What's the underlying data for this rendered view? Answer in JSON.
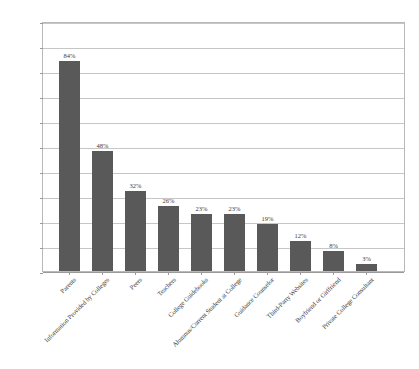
{
  "chart_data": {
    "type": "bar",
    "title": "",
    "xlabel": "",
    "ylabel": "",
    "ylim": [
      0,
      100
    ],
    "grid": true,
    "legend": "none",
    "y_ticks": [
      "0%",
      "10%",
      "20%",
      "30%",
      "40%",
      "50%",
      "60%",
      "70%",
      "80%",
      "90%",
      "100%"
    ],
    "categories": [
      "Parents",
      "Information Provided by Colleges",
      "Peers",
      "Teachers",
      "College Guidebooks",
      "Alumnus/Current Student at College",
      "Guidance Counselor",
      "Third-Party Websites",
      "Boyfriend or Girlfriend",
      "Private College Consultant"
    ],
    "values": [
      84,
      48,
      32,
      26,
      23,
      23,
      19,
      12,
      8,
      3
    ],
    "value_labels": [
      "84%",
      "48%",
      "32%",
      "26%",
      "23%",
      "23%",
      "19%",
      "12%",
      "8%",
      "3%"
    ],
    "colors": {
      "bar": "#595959",
      "gridline": "#c6c6c6",
      "axis": "#9a9a9a",
      "frame": "#b9b9b9",
      "background": "#ffffff",
      "text": "#3c3c3c"
    }
  }
}
